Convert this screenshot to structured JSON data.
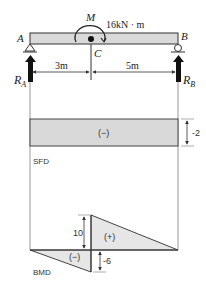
{
  "beam": {
    "label_left": "A",
    "label_right": "B",
    "label_mid": "C",
    "moment_symbol": "M",
    "moment_value": "16kN · m",
    "reaction_left_main": "R",
    "reaction_left_sub": "A",
    "reaction_right_main": "R",
    "reaction_right_sub": "B",
    "span_left": "3m",
    "span_right": "5m"
  },
  "sfd": {
    "label": "SFD",
    "sign": "(−)",
    "value": "-2"
  },
  "bmd": {
    "label": "BMD",
    "positive_sign": "(+)",
    "negative_sign": "(−)",
    "positive_value": "10",
    "negative_value": "-6"
  },
  "colors": {
    "fill": "#d9d9d9",
    "stroke": "#333333",
    "guide": "#999999"
  }
}
